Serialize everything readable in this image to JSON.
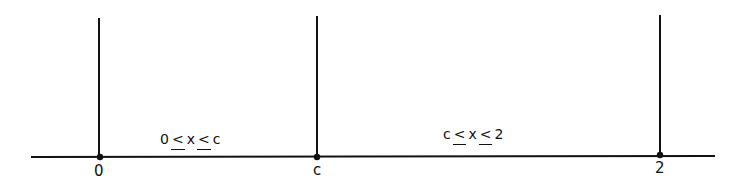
{
  "diagram": {
    "type": "number-line-intervals",
    "points": [
      {
        "label": "0",
        "x": 99,
        "line_top": 18
      },
      {
        "label": "c",
        "x": 317,
        "line_top": 16
      },
      {
        "label": "2",
        "x": 660,
        "line_top": 15
      }
    ],
    "intervals": [
      {
        "left": "0",
        "op1": "<",
        "var": "x",
        "op2": "<",
        "right": "c"
      },
      {
        "left": "c",
        "op1": "<",
        "var": "x",
        "op2": "<",
        "right": "2"
      }
    ],
    "axis": {
      "x1": 31,
      "x2": 715,
      "y": 157
    },
    "color": "#111111"
  }
}
